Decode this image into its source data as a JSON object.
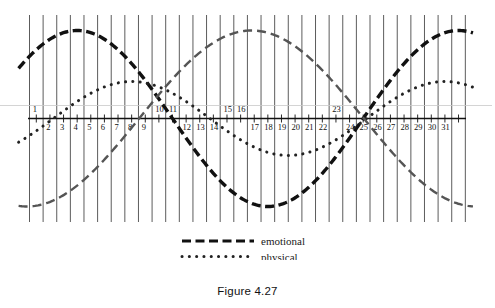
{
  "caption": "Figure 4.27",
  "legend": {
    "position": "bottom-center",
    "items": [
      {
        "label": "emotional",
        "style": "dashed",
        "color": "#111111",
        "width": 3.2
      },
      {
        "label": "physical",
        "style": "dotted",
        "color": "#222222",
        "width": 3.0
      },
      {
        "label": "intellectual",
        "style": "dashed",
        "color": "#555555",
        "width": 2.4
      }
    ]
  },
  "axis": {
    "tick_labels": [
      "1",
      "2",
      "3",
      "4",
      "5",
      "6",
      "7",
      "8",
      "9",
      "10",
      "11",
      "12",
      "13",
      "14",
      "15",
      "16",
      "17",
      "18",
      "19",
      "20",
      "21",
      "22",
      "23",
      "24",
      "25",
      "26",
      "27",
      "28",
      "29",
      "30",
      "31"
    ],
    "labels_above_axis": [
      "1",
      "10",
      "11",
      "15",
      "16",
      "23"
    ],
    "gridlines": true,
    "zero_line": true
  },
  "chart_data": {
    "type": "line",
    "title": "",
    "subtitle": "",
    "xlabel": "",
    "ylabel": "",
    "xlim": [
      0,
      32
    ],
    "ylim": [
      -1,
      1
    ],
    "grid": true,
    "legend_position": "bottom-center",
    "annotations": [],
    "x_tick_labels": [
      "1",
      "2",
      "3",
      "4",
      "5",
      "6",
      "7",
      "8",
      "9",
      "10",
      "11",
      "12",
      "13",
      "14",
      "15",
      "16",
      "17",
      "18",
      "19",
      "20",
      "21",
      "22",
      "23",
      "24",
      "25",
      "26",
      "27",
      "28",
      "29",
      "30",
      "31"
    ],
    "series": [
      {
        "name": "emotional",
        "style": "dashed",
        "color": "#111111",
        "period_days": 28,
        "peak_day": 3.5,
        "trough_day": 17.5,
        "zero_crossings": [
          -3.5,
          10.5,
          24.5
        ],
        "amplitude": 1,
        "x": [
          0,
          1,
          2,
          3,
          4,
          5,
          6,
          7,
          8,
          9,
          10,
          11,
          12,
          13,
          14,
          15,
          16,
          17,
          18,
          19,
          20,
          21,
          22,
          23,
          24,
          25,
          26,
          27,
          28,
          29,
          30,
          31,
          32
        ],
        "values": [
          0.78,
          0.93,
          1.0,
          0.99,
          0.9,
          0.73,
          0.51,
          0.25,
          -0.03,
          -0.31,
          -0.56,
          -0.77,
          -0.92,
          -0.99,
          -0.99,
          -0.91,
          -0.75,
          -0.53,
          -0.27,
          0.01,
          0.29,
          0.54,
          0.76,
          0.91,
          0.99,
          0.99,
          0.9,
          0.74,
          0.52,
          0.26,
          -0.02,
          -0.3,
          -0.55
        ]
      },
      {
        "name": "physical",
        "style": "dotted",
        "color": "#222222",
        "period_days": 23,
        "peak_day": 7.5,
        "trough_day": 19,
        "zero_crossings": [
          1.5,
          13.5,
          25
        ],
        "amplitude": 0.42,
        "x": [
          0,
          1,
          2,
          3,
          4,
          5,
          6,
          7,
          8,
          9,
          10,
          11,
          12,
          13,
          14,
          15,
          16,
          17,
          18,
          19,
          20,
          21,
          22,
          23,
          24,
          25,
          26,
          27,
          28,
          29,
          30,
          31,
          32
        ],
        "values": [
          -0.17,
          -0.06,
          0.07,
          0.18,
          0.27,
          0.35,
          0.4,
          0.42,
          0.42,
          0.39,
          0.33,
          0.26,
          0.16,
          0.05,
          -0.06,
          -0.17,
          -0.27,
          -0.35,
          -0.4,
          -0.42,
          -0.42,
          -0.38,
          -0.32,
          -0.24,
          -0.15,
          -0.04,
          0.07,
          0.18,
          0.28,
          0.36,
          0.41,
          0.42,
          0.41
        ]
      },
      {
        "name": "intellectual",
        "style": "dashed",
        "color": "#555555",
        "period_days": 33,
        "peak_day": 16.3,
        "trough_day": 0,
        "zero_crossings": [
          8.0,
          24.5
        ],
        "amplitude": 1,
        "x": [
          0,
          1,
          2,
          3,
          4,
          5,
          6,
          7,
          8,
          9,
          10,
          11,
          12,
          13,
          14,
          15,
          16,
          17,
          18,
          19,
          20,
          21,
          22,
          23,
          24,
          25,
          26,
          27,
          28,
          29,
          30,
          31,
          32
        ],
        "values": [
          -1.0,
          -0.98,
          -0.93,
          -0.84,
          -0.72,
          -0.57,
          -0.4,
          -0.21,
          -0.02,
          0.17,
          0.36,
          0.53,
          0.69,
          0.82,
          0.92,
          0.98,
          1.0,
          0.98,
          0.93,
          0.84,
          0.71,
          0.56,
          0.38,
          0.19,
          0.0,
          -0.2,
          -0.38,
          -0.56,
          -0.71,
          -0.83,
          -0.92,
          -0.98,
          -1.0
        ]
      }
    ]
  }
}
